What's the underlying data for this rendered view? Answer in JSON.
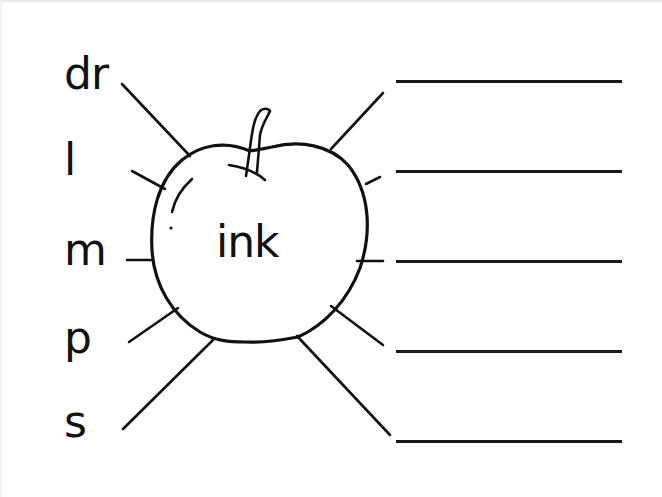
{
  "worksheet": {
    "center_word": "ink",
    "onsets": [
      {
        "label": "dr"
      },
      {
        "label": "l"
      },
      {
        "label": "m"
      },
      {
        "label": "p"
      },
      {
        "label": "s"
      }
    ],
    "answer_lines": [
      {
        "value": ""
      },
      {
        "value": ""
      },
      {
        "value": ""
      },
      {
        "value": ""
      },
      {
        "value": ""
      }
    ],
    "illustration": "apple-icon",
    "colors": {
      "ink": "#111111",
      "background": "#ffffff"
    }
  }
}
